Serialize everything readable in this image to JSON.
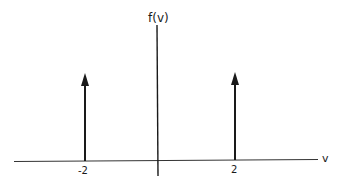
{
  "diagram": {
    "y_axis_label": "f(v)",
    "x_axis_label": "v",
    "impulses": [
      {
        "position_label": "-2",
        "value": -2
      },
      {
        "position_label": "2",
        "value": 2
      }
    ],
    "colors": {
      "ink": "#1a1a1a",
      "background": "#ffffff"
    }
  }
}
